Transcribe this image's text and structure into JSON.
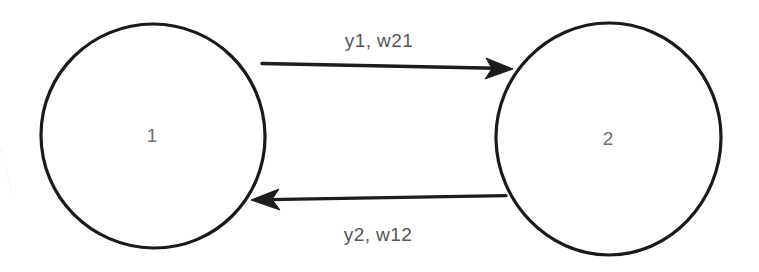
{
  "diagram": {
    "type": "directed-graph",
    "title": "",
    "background_color": "#ffffff",
    "stroke_color": "#1a1a1a",
    "node_label_color": "#6e6e6e",
    "edge_label_color": "#555555",
    "nodes": [
      {
        "id": "node-1",
        "label": "1",
        "cx": 153,
        "cy": 136,
        "r": 112
      },
      {
        "id": "node-2",
        "label": "2",
        "cx": 609,
        "cy": 139,
        "r": 113
      }
    ],
    "edges": [
      {
        "id": "edge-1-to-2",
        "label": "y1, w21",
        "from": "node-1",
        "to": "node-2",
        "direction": "left-to-right",
        "label_x": 379,
        "label_y": 47,
        "x1": 262,
        "y1": 64,
        "x2": 512,
        "y2": 69
      },
      {
        "id": "edge-2-to-1",
        "label": "y2, w12",
        "from": "node-2",
        "to": "node-1",
        "direction": "right-to-left",
        "label_x": 378,
        "label_y": 241,
        "x1": 506,
        "y1": 196,
        "x2": 252,
        "y2": 200
      }
    ]
  }
}
